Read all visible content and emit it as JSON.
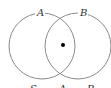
{
  "diagram": {
    "type": "venn",
    "sets": [
      {
        "label": "A",
        "cx": 42,
        "cy": 46,
        "r": 33
      },
      {
        "label": "B",
        "cx": 79,
        "cy": 46,
        "r": 33
      }
    ],
    "point": {
      "cx": 63,
      "cy": 45,
      "region": "A∩B"
    },
    "bottom_labels": [
      "S",
      "A",
      "B"
    ],
    "colors": {
      "stroke": "#8a8a8a",
      "point": "#000000",
      "text": "#333333"
    }
  }
}
